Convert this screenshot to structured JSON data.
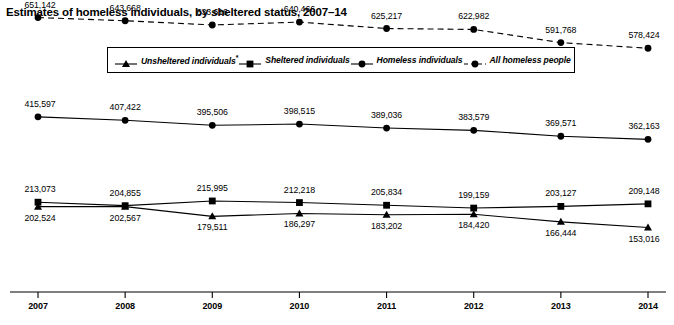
{
  "chart_data": {
    "type": "line",
    "title": "Estimates of homeless individuals, by sheltered status, 2007–14",
    "xlabel": "",
    "ylabel": "",
    "categories": [
      "2007",
      "2008",
      "2009",
      "2010",
      "2011",
      "2012",
      "2013",
      "2014"
    ],
    "ylim": [
      0,
      700000
    ],
    "grid": false,
    "legend_position": "top-center",
    "series": [
      {
        "name": "Unsheltered individuals*",
        "marker": "triangle",
        "line_style": "solid",
        "label_position": "below",
        "values": [
          202524,
          202567,
          179511,
          186297,
          183202,
          184420,
          166444,
          153016
        ],
        "labels": [
          "202,524",
          "202,567",
          "179,511",
          "186,297",
          "183,202",
          "184,420",
          "166,444",
          "153,016"
        ]
      },
      {
        "name": "Sheltered individuals",
        "marker": "square",
        "line_style": "solid",
        "label_position": "above",
        "values": [
          213073,
          204855,
          215995,
          212218,
          205834,
          199159,
          203127,
          209148
        ],
        "labels": [
          "213,073",
          "204,855",
          "215,995",
          "212,218",
          "205,834",
          "199,159",
          "203,127",
          "209,148"
        ]
      },
      {
        "name": "Homeless individuals",
        "marker": "circle",
        "line_style": "solid",
        "label_position": "above",
        "values": [
          415597,
          407422,
          395506,
          398515,
          389036,
          383579,
          369571,
          362163
        ],
        "labels": [
          "415,597",
          "407,422",
          "395,506",
          "398,515",
          "389,036",
          "383,579",
          "369,571",
          "362,163"
        ]
      },
      {
        "name": "All homeless people",
        "marker": "circle",
        "line_style": "dashed",
        "label_position": "above",
        "values": [
          651142,
          643668,
          633616,
          640466,
          625217,
          622982,
          591768,
          578424
        ],
        "labels": [
          "651,142",
          "643,668",
          "633,616",
          "640,466",
          "625,217",
          "622,982",
          "591,768",
          "578,424"
        ]
      }
    ]
  },
  "legend": {
    "items": [
      {
        "label": "Unsheltered individuals",
        "note": "*",
        "marker": "triangle",
        "line_style": "solid"
      },
      {
        "label": "Sheltered individuals",
        "note": "",
        "marker": "square",
        "line_style": "solid"
      },
      {
        "label": "Homeless individuals",
        "note": "",
        "marker": "circle",
        "line_style": "solid"
      },
      {
        "label": "All homeless people",
        "note": "",
        "marker": "circle",
        "line_style": "dashed"
      }
    ]
  },
  "colors": {
    "line": "#000000",
    "marker": "#000000",
    "axis": "#000000",
    "background": "#ffffff",
    "text": "#000000"
  }
}
